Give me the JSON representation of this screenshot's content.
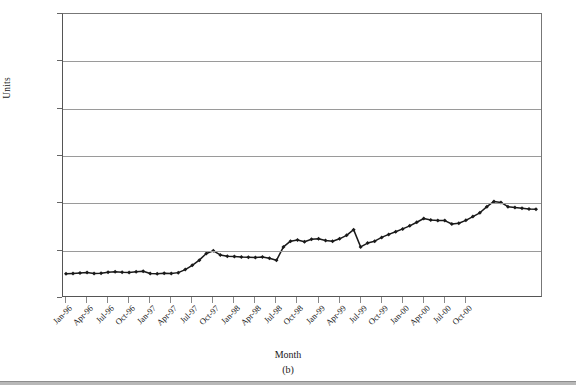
{
  "chart_data": {
    "type": "line",
    "title": "",
    "caption": "(b)",
    "xlabel": "Month",
    "ylabel": "Units",
    "ylim": [
      0,
      3000
    ],
    "yticks": [
      0,
      500,
      1000,
      1500,
      2000,
      2500,
      3000
    ],
    "grid": true,
    "legend": "none",
    "marker": "filled-diamond",
    "line_color": "#1a1a1a",
    "x": [
      "Jan-96",
      "Feb-96",
      "Mar-96",
      "Apr-96",
      "May-96",
      "Jun-96",
      "Jul-96",
      "Aug-96",
      "Sep-96",
      "Oct-96",
      "Nov-96",
      "Dec-96",
      "Jan-97",
      "Feb-97",
      "Mar-97",
      "Apr-97",
      "May-97",
      "Jun-97",
      "Jul-97",
      "Aug-97",
      "Sep-97",
      "Oct-97",
      "Nov-97",
      "Dec-97",
      "Jan-98",
      "Feb-98",
      "Mar-98",
      "Apr-98",
      "May-98",
      "Jun-98",
      "Jul-98",
      "Aug-98",
      "Sep-98",
      "Oct-98",
      "Nov-98",
      "Dec-98",
      "Jan-99",
      "Feb-99",
      "Mar-99",
      "Apr-99",
      "May-99",
      "Jun-99",
      "Jul-99",
      "Aug-99",
      "Sep-99",
      "Oct-99",
      "Nov-99",
      "Dec-99",
      "Jan-00",
      "Feb-00",
      "Mar-00",
      "Apr-00",
      "May-00",
      "Jun-00",
      "Jul-00",
      "Aug-00",
      "Sep-00",
      "Oct-00",
      "Nov-00",
      "Dec-00"
    ],
    "xtick_labels": [
      "Jan-96",
      "Apr-96",
      "Jul-96",
      "Oct-96",
      "Jan-97",
      "Apr-97",
      "Jul-97",
      "Oct-97",
      "Jan-98",
      "Apr-98",
      "Jul-98",
      "Oct-98",
      "Jan-99",
      "Apr-99",
      "Jul-99",
      "Oct-99",
      "Jan-00",
      "Apr-00",
      "Jul-00",
      "Oct-00"
    ],
    "xtick_indices": [
      0,
      3,
      6,
      9,
      12,
      15,
      18,
      21,
      24,
      27,
      30,
      33,
      36,
      39,
      42,
      45,
      48,
      51,
      54,
      57
    ],
    "values": [
      255,
      260,
      265,
      270,
      258,
      262,
      272,
      278,
      272,
      270,
      278,
      282,
      258,
      256,
      262,
      258,
      268,
      300,
      345,
      400,
      470,
      498,
      455,
      440,
      438,
      432,
      430,
      428,
      432,
      420,
      398,
      540,
      600,
      612,
      595,
      620,
      625,
      608,
      600,
      625,
      662,
      722,
      540,
      580,
      600,
      640,
      672,
      700,
      730,
      762,
      800,
      840,
      825,
      818,
      818,
      782,
      790,
      820,
      860,
      900
    ],
    "values_tail": [
      965,
      1020,
      1010,
      965,
      955,
      948,
      940,
      938
    ],
    "series_name": "Units"
  },
  "figure": {
    "xlabel": "Month",
    "ylabel": "Units",
    "caption": "(b)"
  }
}
